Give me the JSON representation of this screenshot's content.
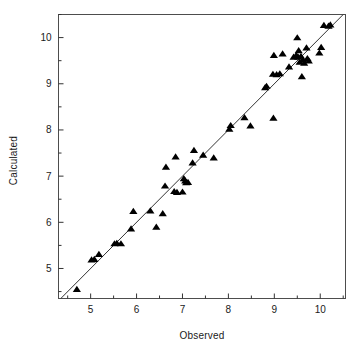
{
  "chart_data": {
    "type": "scatter",
    "title": "",
    "xlabel": "Observed",
    "ylabel": "Calculated",
    "xlim": [
      4.3,
      10.55
    ],
    "ylim": [
      4.35,
      10.5
    ],
    "xticks": [
      5,
      6,
      7,
      8,
      9,
      10
    ],
    "yticks": [
      5,
      6,
      7,
      8,
      9,
      10
    ],
    "xtick_labels": [
      "5",
      "6",
      "7",
      "8",
      "9",
      "10"
    ],
    "ytick_labels": [
      "5",
      "6",
      "7",
      "8",
      "9",
      "10"
    ],
    "minor_tick_step": 0.5,
    "grid": false,
    "legend": null,
    "marker": "triangle-up",
    "marker_color": "#000000",
    "marker_size": 5,
    "reference_line": {
      "name": "identity-line",
      "type": "line",
      "slope": 1,
      "intercept": 0,
      "color": "#333333",
      "width": 1,
      "x_from": 4.3,
      "x_to": 10.55
    },
    "points": [
      {
        "x": 4.7,
        "y": 4.55
      },
      {
        "x": 5.02,
        "y": 5.19
      },
      {
        "x": 5.08,
        "y": 5.2
      },
      {
        "x": 5.18,
        "y": 5.31
      },
      {
        "x": 5.52,
        "y": 5.54
      },
      {
        "x": 5.57,
        "y": 5.55
      },
      {
        "x": 5.66,
        "y": 5.54
      },
      {
        "x": 5.88,
        "y": 5.86
      },
      {
        "x": 5.93,
        "y": 6.24
      },
      {
        "x": 6.3,
        "y": 6.25
      },
      {
        "x": 6.43,
        "y": 5.9
      },
      {
        "x": 6.57,
        "y": 6.19
      },
      {
        "x": 6.62,
        "y": 6.79
      },
      {
        "x": 6.64,
        "y": 7.2
      },
      {
        "x": 6.82,
        "y": 6.67
      },
      {
        "x": 6.88,
        "y": 6.65
      },
      {
        "x": 6.85,
        "y": 7.42
      },
      {
        "x": 7.0,
        "y": 6.66
      },
      {
        "x": 7.03,
        "y": 6.95
      },
      {
        "x": 7.06,
        "y": 6.9
      },
      {
        "x": 7.08,
        "y": 6.86
      },
      {
        "x": 7.12,
        "y": 6.87
      },
      {
        "x": 7.22,
        "y": 7.29
      },
      {
        "x": 7.25,
        "y": 7.56
      },
      {
        "x": 7.45,
        "y": 7.46
      },
      {
        "x": 7.68,
        "y": 7.4
      },
      {
        "x": 8.02,
        "y": 8.02
      },
      {
        "x": 8.05,
        "y": 8.1
      },
      {
        "x": 8.35,
        "y": 8.27
      },
      {
        "x": 8.48,
        "y": 8.09
      },
      {
        "x": 8.8,
        "y": 8.92
      },
      {
        "x": 8.83,
        "y": 8.95
      },
      {
        "x": 8.97,
        "y": 9.21
      },
      {
        "x": 8.98,
        "y": 8.26
      },
      {
        "x": 8.99,
        "y": 9.62
      },
      {
        "x": 9.05,
        "y": 9.2
      },
      {
        "x": 9.12,
        "y": 9.22
      },
      {
        "x": 9.18,
        "y": 9.65
      },
      {
        "x": 9.32,
        "y": 9.37
      },
      {
        "x": 9.42,
        "y": 9.58
      },
      {
        "x": 9.47,
        "y": 9.6
      },
      {
        "x": 9.48,
        "y": 9.62
      },
      {
        "x": 9.5,
        "y": 10.0
      },
      {
        "x": 9.52,
        "y": 9.58
      },
      {
        "x": 9.53,
        "y": 9.72
      },
      {
        "x": 9.55,
        "y": 9.47
      },
      {
        "x": 9.58,
        "y": 9.6
      },
      {
        "x": 9.6,
        "y": 9.16
      },
      {
        "x": 9.62,
        "y": 9.52
      },
      {
        "x": 9.65,
        "y": 9.45
      },
      {
        "x": 9.7,
        "y": 9.78
      },
      {
        "x": 9.72,
        "y": 9.55
      },
      {
        "x": 9.75,
        "y": 9.5
      },
      {
        "x": 9.98,
        "y": 9.67
      },
      {
        "x": 10.02,
        "y": 9.79
      },
      {
        "x": 10.08,
        "y": 10.27
      },
      {
        "x": 10.18,
        "y": 10.25
      },
      {
        "x": 10.22,
        "y": 10.28
      }
    ]
  },
  "axes": {
    "frame_color": "#4d4d4d",
    "tick_color": "#333333",
    "background": "#ffffff"
  }
}
